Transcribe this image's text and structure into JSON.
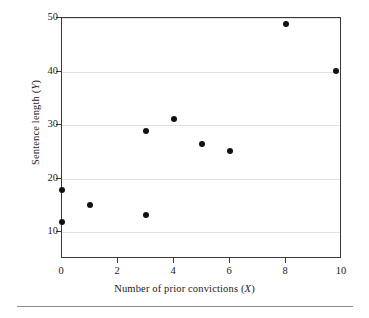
{
  "chart_data": {
    "type": "scatter",
    "title": "",
    "xlabel": "Number of prior convictions (X)",
    "ylabel": "Sentence length (Y)",
    "xlim": [
      0,
      10
    ],
    "ylim": [
      5,
      50
    ],
    "xticks": [
      0,
      2,
      4,
      6,
      8,
      10
    ],
    "xtick_labels": [
      "0",
      "2",
      "4",
      "6",
      "8",
      "10"
    ],
    "yticks": [
      10,
      20,
      30,
      40,
      50
    ],
    "ytick_labels": [
      "10",
      "20",
      "30",
      "40",
      "50"
    ],
    "grid": true,
    "gridlines_y": [
      10,
      20,
      30,
      40,
      50
    ],
    "legend": null,
    "marker": "filled-circle",
    "marker_color": "#121212",
    "points": [
      {
        "x": 0,
        "y": 17.8
      },
      {
        "x": 0,
        "y": 12.0
      },
      {
        "x": 1,
        "y": 15.0
      },
      {
        "x": 3,
        "y": 28.9
      },
      {
        "x": 3,
        "y": 13.2
      },
      {
        "x": 4,
        "y": 31.2
      },
      {
        "x": 5,
        "y": 26.4
      },
      {
        "x": 6,
        "y": 25.1
      },
      {
        "x": 8,
        "y": 48.8
      },
      {
        "x": 9.8,
        "y": 40.2
      }
    ]
  },
  "axis_titles": {
    "x_prefix": "Number of prior convictions (",
    "x_variable": "X",
    "x_suffix": ")",
    "y_prefix": "Sentence length (",
    "y_variable": "Y",
    "y_suffix": ")"
  },
  "colors": {
    "marker": "#121212",
    "frame": "#3a3a3a",
    "gridline": "#e2e2e2",
    "rule": "#8e8e8e",
    "background": "#ffffff"
  }
}
